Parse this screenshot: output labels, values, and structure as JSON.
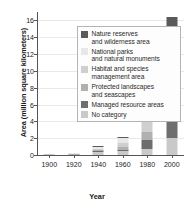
{
  "chart_data": {
    "type": "bar",
    "stacked": true,
    "title": "",
    "xlabel": "Year",
    "ylabel": "Area (million square kilometers)",
    "categories": [
      "1900",
      "1920",
      "1940",
      "1960",
      "1980",
      "2000"
    ],
    "x": [
      1900,
      1920,
      1940,
      1960,
      1980,
      2000
    ],
    "xlim": [
      1890,
      2010
    ],
    "ylim": [
      0,
      17
    ],
    "yticks": [
      "0",
      "2",
      "4",
      "6",
      "8",
      "10",
      "12",
      "14",
      "16"
    ],
    "ytick_values": [
      0,
      2,
      4,
      6,
      8,
      10,
      12,
      14,
      16
    ],
    "xticks": [
      "1900",
      "1920",
      "1940",
      "1960",
      "1980",
      "2000"
    ],
    "grid": true,
    "legend_position": "upper-left-inside",
    "series": [
      {
        "name": "No category",
        "color": "#c9c9c9",
        "values": [
          0.04,
          0.07,
          0.35,
          0.55,
          0.7,
          2.0
        ]
      },
      {
        "name": "Managed resource areas",
        "color": "#6e6e6e",
        "values": [
          0.0,
          0.0,
          0.12,
          0.1,
          1.05,
          3.4
        ]
      },
      {
        "name": "Protected landscapes and seascapes",
        "color": "#b0b0b0",
        "values": [
          0.0,
          0.02,
          0.1,
          0.35,
          1.0,
          1.3
        ]
      },
      {
        "name": "Habitat and species management area",
        "color": "#cfcfcf",
        "values": [
          0.0,
          0.01,
          0.1,
          0.45,
          1.6,
          2.3
        ]
      },
      {
        "name": "National parks and natural monuments",
        "color": "#e8e8e8",
        "values": [
          0.0,
          0.02,
          0.25,
          0.6,
          3.7,
          6.0
        ]
      },
      {
        "name": "Nature reserves and wilderness area",
        "color": "#5a5a5a",
        "values": [
          0.0,
          0.0,
          0.1,
          0.07,
          0.45,
          1.4
        ]
      }
    ],
    "totals": [
      0.04,
      0.12,
      1.02,
      2.12,
      8.5,
      16.4
    ],
    "legend_entries": [
      {
        "label_line1": "Nature reserves",
        "label_line2": "and wilderness area",
        "color": "#5a5a5a"
      },
      {
        "label_line1": "National parks",
        "label_line2": "and natural monuments",
        "color": "#e8e8e8"
      },
      {
        "label_line1": "Habitat and species",
        "label_line2": "management area",
        "color": "#cfcfcf"
      },
      {
        "label_line1": "Protected landscapes",
        "label_line2": "and seascapes",
        "color": "#b0b0b0"
      },
      {
        "label_line1": "Managed resource areas",
        "label_line2": "",
        "color": "#6e6e6e"
      },
      {
        "label_line1": "No category",
        "label_line2": "",
        "color": "#c9c9c9"
      }
    ]
  }
}
